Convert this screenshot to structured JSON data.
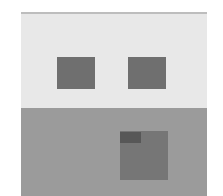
{
  "figure": {
    "colors": {
      "background": "#ffffff",
      "upper_panel": "#e8e8e8",
      "lower_panel": "#9b9b9b",
      "window": "#6f6f6f",
      "door": "#767676",
      "door_tab": "#575757",
      "top_border": "#bdbdbd"
    },
    "elements": [
      {
        "name": "upper-panel"
      },
      {
        "name": "lower-panel"
      },
      {
        "name": "left-window"
      },
      {
        "name": "right-window"
      },
      {
        "name": "door"
      },
      {
        "name": "door-tab"
      }
    ]
  }
}
